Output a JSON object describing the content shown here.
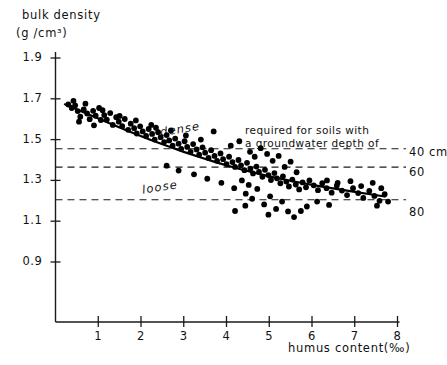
{
  "chart_data": {
    "type": "scatter",
    "title": "",
    "ylabel_line1": "bulk density",
    "ylabel_line2": "(g /cm³)",
    "xlabel": "humus content(‰)",
    "xlim": [
      0,
      8
    ],
    "ylim": [
      0.82,
      1.98
    ],
    "xticks": [
      "1",
      "2",
      "3",
      "4",
      "5",
      "6",
      "7",
      "8"
    ],
    "xtick_values": [
      1,
      2,
      3,
      4,
      5,
      6,
      7,
      8
    ],
    "yticks": [
      "1.9",
      "1.7",
      "1.5",
      "1.3",
      "1.1",
      "0.9"
    ],
    "ytick_values": [
      1.9,
      1.7,
      1.5,
      1.3,
      1.1,
      0.9
    ],
    "grid": false,
    "legend_position": "none",
    "annotations": [
      {
        "name": "dense-label",
        "text": "dense",
        "x": 3.6,
        "y": 1.545,
        "style": "italic"
      },
      {
        "name": "loose-label",
        "text": "loose",
        "x": 3.0,
        "y": 1.315,
        "style": "italic"
      },
      {
        "name": "threshold-note-line1",
        "text": "required for soils with",
        "x": 5.05,
        "y": 1.62
      },
      {
        "name": "threshold-note-line2",
        "text": "a groundwater depth of",
        "x": 5.05,
        "y": 1.565
      }
    ],
    "threshold_lines": [
      {
        "label": "40 cm",
        "value": 1.455,
        "style": "dashed"
      },
      {
        "label": "60",
        "value": 1.365,
        "style": "dashed"
      },
      {
        "label": "80",
        "value": 1.205,
        "style": "dashed"
      }
    ],
    "fit_curve": {
      "name": "regression-curve",
      "description": "decreasing trend line of bulk density with humus content",
      "points": [
        [
          0.22,
          1.673
        ],
        [
          0.6,
          1.639
        ],
        [
          1.0,
          1.603
        ],
        [
          1.4,
          1.568
        ],
        [
          1.8,
          1.534
        ],
        [
          2.2,
          1.501
        ],
        [
          2.6,
          1.47
        ],
        [
          3.0,
          1.44
        ],
        [
          3.4,
          1.412
        ],
        [
          3.8,
          1.386
        ],
        [
          4.2,
          1.362
        ],
        [
          4.6,
          1.34
        ],
        [
          5.0,
          1.32
        ],
        [
          5.4,
          1.302
        ],
        [
          5.8,
          1.286
        ],
        [
          6.2,
          1.271
        ],
        [
          6.6,
          1.257
        ],
        [
          7.0,
          1.244
        ],
        [
          7.4,
          1.231
        ],
        [
          7.7,
          1.221
        ]
      ]
    },
    "series": [
      {
        "name": "soil samples",
        "marker": "filled-circle",
        "color": "#000000",
        "points": [
          [
            0.3,
            1.672
          ],
          [
            0.38,
            1.655
          ],
          [
            0.46,
            1.668
          ],
          [
            0.52,
            1.64
          ],
          [
            0.58,
            1.612
          ],
          [
            0.66,
            1.648
          ],
          [
            0.74,
            1.628
          ],
          [
            0.8,
            1.6
          ],
          [
            0.88,
            1.641
          ],
          [
            0.94,
            1.617
          ],
          [
            1.02,
            1.655
          ],
          [
            1.06,
            1.596
          ],
          [
            1.14,
            1.62
          ],
          [
            1.2,
            1.598
          ],
          [
            1.28,
            1.63
          ],
          [
            1.34,
            1.572
          ],
          [
            1.42,
            1.61
          ],
          [
            1.48,
            1.588
          ],
          [
            1.56,
            1.566
          ],
          [
            1.62,
            1.601
          ],
          [
            1.7,
            1.548
          ],
          [
            1.76,
            1.578
          ],
          [
            1.84,
            1.556
          ],
          [
            1.9,
            1.53
          ],
          [
            1.98,
            1.565
          ],
          [
            2.04,
            1.54
          ],
          [
            2.12,
            1.518
          ],
          [
            2.18,
            1.552
          ],
          [
            2.26,
            1.528
          ],
          [
            2.32,
            1.5
          ],
          [
            2.4,
            1.536
          ],
          [
            2.46,
            1.512
          ],
          [
            2.54,
            1.488
          ],
          [
            2.6,
            1.522
          ],
          [
            2.66,
            1.496
          ],
          [
            2.74,
            1.47
          ],
          [
            2.8,
            1.505
          ],
          [
            2.88,
            1.48
          ],
          [
            2.94,
            1.455
          ],
          [
            3.02,
            1.492
          ],
          [
            3.08,
            1.464
          ],
          [
            3.16,
            1.44
          ],
          [
            3.22,
            1.478
          ],
          [
            3.3,
            1.452
          ],
          [
            3.36,
            1.426
          ],
          [
            3.44,
            1.462
          ],
          [
            3.5,
            1.436
          ],
          [
            3.58,
            1.41
          ],
          [
            3.64,
            1.448
          ],
          [
            3.72,
            1.42
          ],
          [
            3.78,
            1.396
          ],
          [
            3.86,
            1.432
          ],
          [
            3.92,
            1.404
          ],
          [
            4.0,
            1.38
          ],
          [
            4.06,
            1.416
          ],
          [
            4.14,
            1.39
          ],
          [
            4.2,
            1.366
          ],
          [
            4.28,
            1.4
          ],
          [
            4.34,
            1.374
          ],
          [
            4.42,
            1.35
          ],
          [
            4.48,
            1.386
          ],
          [
            4.56,
            1.358
          ],
          [
            4.62,
            1.334
          ],
          [
            4.7,
            1.368
          ],
          [
            4.76,
            1.342
          ],
          [
            4.84,
            1.318
          ],
          [
            4.9,
            1.352
          ],
          [
            4.98,
            1.326
          ],
          [
            5.04,
            1.302
          ],
          [
            5.12,
            1.336
          ],
          [
            5.18,
            1.31
          ],
          [
            5.26,
            1.286
          ],
          [
            5.32,
            1.32
          ],
          [
            5.4,
            1.294
          ],
          [
            5.46,
            1.27
          ],
          [
            5.54,
            1.304
          ],
          [
            5.62,
            1.28
          ],
          [
            5.7,
            1.256
          ],
          [
            5.78,
            1.29
          ],
          [
            5.86,
            1.266
          ],
          [
            5.94,
            1.3
          ],
          [
            6.04,
            1.276
          ],
          [
            6.14,
            1.252
          ],
          [
            6.24,
            1.286
          ],
          [
            6.34,
            1.262
          ],
          [
            6.46,
            1.24
          ],
          [
            6.58,
            1.274
          ],
          [
            6.7,
            1.25
          ],
          [
            6.82,
            1.228
          ],
          [
            6.96,
            1.262
          ],
          [
            7.08,
            1.238
          ],
          [
            7.2,
            1.214
          ],
          [
            7.34,
            1.248
          ],
          [
            7.46,
            1.224
          ],
          [
            7.58,
            1.2
          ],
          [
            7.7,
            1.232
          ],
          [
            2.35,
            1.558
          ],
          [
            2.7,
            1.545
          ],
          [
            3.05,
            1.52
          ],
          [
            3.4,
            1.5
          ],
          [
            3.7,
            1.54
          ],
          [
            4.1,
            1.47
          ],
          [
            4.3,
            1.492
          ],
          [
            4.55,
            1.44
          ],
          [
            4.66,
            1.416
          ],
          [
            4.8,
            1.458
          ],
          [
            4.95,
            1.43
          ],
          [
            5.08,
            1.396
          ],
          [
            5.22,
            1.42
          ],
          [
            5.36,
            1.366
          ],
          [
            5.5,
            1.392
          ],
          [
            5.64,
            1.34
          ],
          [
            4.45,
            1.235
          ],
          [
            4.6,
            1.21
          ],
          [
            4.72,
            1.258
          ],
          [
            4.88,
            1.182
          ],
          [
            5.02,
            1.222
          ],
          [
            5.16,
            1.16
          ],
          [
            5.3,
            1.196
          ],
          [
            5.44,
            1.148
          ],
          [
            3.24,
            1.33
          ],
          [
            3.55,
            1.308
          ],
          [
            3.88,
            1.288
          ],
          [
            4.18,
            1.262
          ],
          [
            4.36,
            1.3
          ],
          [
            4.52,
            1.278
          ],
          [
            2.88,
            1.348
          ],
          [
            2.6,
            1.372
          ],
          [
            6.35,
            1.3
          ],
          [
            6.6,
            1.288
          ],
          [
            6.9,
            1.296
          ],
          [
            7.15,
            1.272
          ],
          [
            7.42,
            1.288
          ],
          [
            7.62,
            1.262
          ],
          [
            7.78,
            1.196
          ],
          [
            7.52,
            1.176
          ],
          [
            6.12,
            1.196
          ],
          [
            6.4,
            1.18
          ],
          [
            5.88,
            1.172
          ],
          [
            5.58,
            1.12
          ],
          [
            4.2,
            1.15
          ],
          [
            4.44,
            1.176
          ],
          [
            4.98,
            1.132
          ],
          [
            5.74,
            1.15
          ],
          [
            0.42,
            1.69
          ],
          [
            0.7,
            1.676
          ],
          [
            1.1,
            1.644
          ],
          [
            1.5,
            1.616
          ],
          [
            1.88,
            1.594
          ],
          [
            2.24,
            1.572
          ],
          [
            0.55,
            1.588
          ],
          [
            0.9,
            1.57
          ]
        ]
      }
    ]
  }
}
